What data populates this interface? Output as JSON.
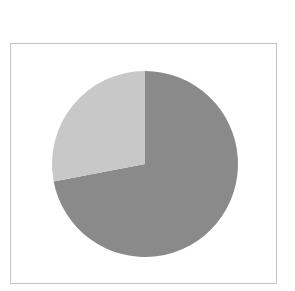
{
  "chart_data": {
    "type": "pie",
    "title": "",
    "labels": [
      "Slice A",
      "Slice B"
    ],
    "values": [
      72,
      28
    ],
    "colors": [
      "#8a8a8a",
      "#c8c8c8"
    ],
    "start_angle_deg": 0,
    "direction": "clockwise",
    "legend": null,
    "center": [
      145,
      164
    ],
    "radius": 93
  }
}
